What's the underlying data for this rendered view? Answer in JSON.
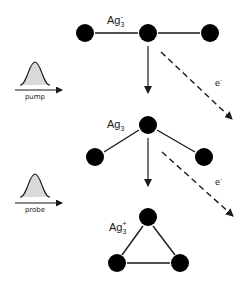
{
  "diagram": {
    "type": "photodetachment-ionization scheme",
    "colors": {
      "atom": "#000000",
      "bond": "#1a1a1a",
      "pulse_fill": "#d9d9d9",
      "text": "#1a1a1a"
    },
    "pulses": [
      {
        "id": "pump",
        "label": "pump"
      },
      {
        "id": "probe",
        "label": "probe"
      }
    ],
    "stages": [
      {
        "id": "anion",
        "species": "Ag",
        "subscript": "3",
        "charge": "-",
        "geometry": "linear",
        "atoms": [
          {
            "x": 85,
            "y": 33
          },
          {
            "x": 148,
            "y": 33
          },
          {
            "x": 210,
            "y": 33
          }
        ]
      },
      {
        "id": "neutral",
        "species": "Ag",
        "subscript": "3",
        "charge": "",
        "geometry": "bent",
        "atoms": [
          {
            "x": 95,
            "y": 157
          },
          {
            "x": 148,
            "y": 125
          },
          {
            "x": 204,
            "y": 157
          }
        ]
      },
      {
        "id": "cation",
        "species": "Ag",
        "subscript": "3",
        "charge": "+",
        "geometry": "triangular",
        "atoms": [
          {
            "x": 148,
            "y": 217
          },
          {
            "x": 117,
            "y": 263
          },
          {
            "x": 180,
            "y": 263
          }
        ]
      }
    ],
    "electron_labels": [
      {
        "text": "e",
        "charge": "-"
      },
      {
        "text": "e",
        "charge": "-"
      }
    ]
  }
}
